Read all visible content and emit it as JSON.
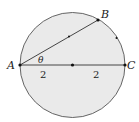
{
  "diagram": {
    "points": {
      "A": "A",
      "B": "B",
      "C": "C"
    },
    "angle_label": "θ",
    "segment_labels": [
      "2",
      "2"
    ],
    "fill_color": "#eaeaea",
    "stroke_color": "#444444"
  }
}
